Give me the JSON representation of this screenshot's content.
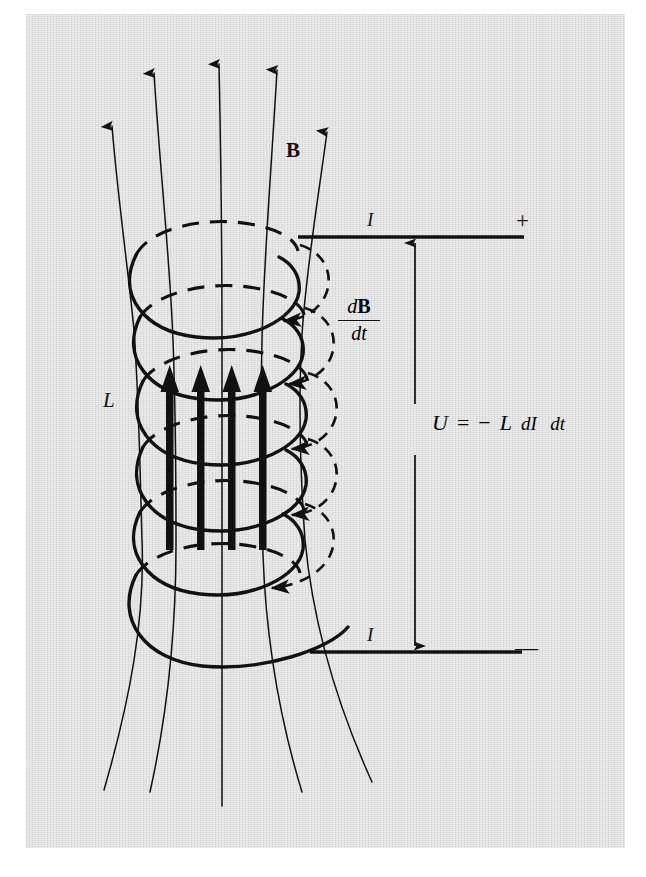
{
  "figure": {
    "background_color": "#ffffff",
    "plate_color": "#e3e3e3",
    "ink_color": "#111111"
  },
  "labels": {
    "field_label": "B",
    "inductance_label": "L",
    "current_top": "I",
    "current_bottom": "I",
    "terminal_positive": "+",
    "terminal_negative": "—"
  },
  "rate_fraction": {
    "numerator_d": "d",
    "numerator_var": "B",
    "denominator": "dt"
  },
  "formula": {
    "quantity": "U",
    "equals": "=",
    "sign": "−",
    "inductance": "L",
    "fraction_numerator": "dI",
    "fraction_denominator": "dt",
    "plain_text": "U = − L dI/dt"
  },
  "icons": {
    "b_field_arrow": "field-line-arrow-icon",
    "current_arrow_top": "current-arrow-left-icon",
    "current_arrow_bottom": "current-arrow-right-icon",
    "flux_arrow": "flux-up-arrow-icon",
    "dashed_circulation_arrow": "circulation-arrow-icon",
    "voltage_span_arrow": "voltage-double-arrow-icon"
  },
  "diagram_elements": {
    "coil_turns": 6,
    "field_lines": 5,
    "flux_arrows": 4,
    "circulation_arrows": 4
  }
}
